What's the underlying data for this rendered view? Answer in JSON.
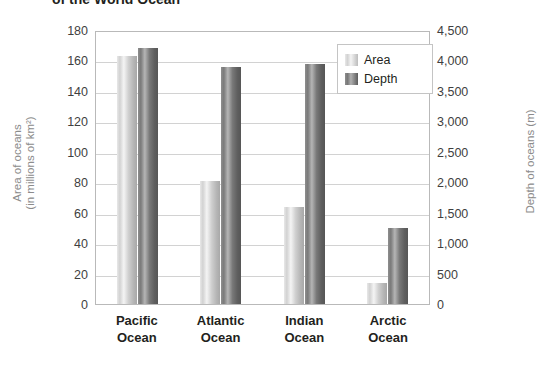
{
  "title": "of the World Ocean",
  "axes": {
    "left_title_line1": "Area of oceans",
    "left_title_line2": "(in millions of km²)",
    "right_title": "Depth of oceans (m)",
    "left_ticks": [
      "180",
      "160",
      "140",
      "120",
      "100",
      "80",
      "60",
      "40",
      "20",
      "0"
    ],
    "right_ticks": [
      "4,500",
      "4,000",
      "3,500",
      "3,000",
      "2,500",
      "2,000",
      "1,500",
      "1,000",
      "500",
      "0"
    ]
  },
  "legend": {
    "items": [
      {
        "label": "Area",
        "color": "#d2d2d2"
      },
      {
        "label": "Depth",
        "color": "#787878"
      }
    ]
  },
  "categories_display": [
    {
      "line1": "Pacific",
      "line2": "Ocean"
    },
    {
      "line1": "Atlantic",
      "line2": "Ocean"
    },
    {
      "line1": "Indian",
      "line2": "Ocean"
    },
    {
      "line1": "Arctic",
      "line2": "Ocean"
    }
  ],
  "chart_data": {
    "type": "bar",
    "title": "of the World Ocean",
    "categories": [
      "Pacific Ocean",
      "Atlantic Ocean",
      "Indian Ocean",
      "Arctic Ocean"
    ],
    "series": [
      {
        "name": "Area",
        "axis": "left",
        "unit": "millions of km²",
        "values": [
          163,
          81,
          64,
          14
        ],
        "color": "#d2d2d2"
      },
      {
        "name": "Depth",
        "axis": "right",
        "unit": "m",
        "values": [
          4200,
          3900,
          3950,
          1250
        ],
        "color": "#787878"
      }
    ],
    "xlabel": "",
    "ylabel": "Area of oceans (in millions of km²)",
    "y2label": "Depth of oceans (m)",
    "ylim": [
      0,
      180
    ],
    "y2lim": [
      0,
      4500
    ],
    "ytick_step": 20,
    "y2tick_step": 500,
    "grid": true,
    "legend_position": "top-right"
  }
}
